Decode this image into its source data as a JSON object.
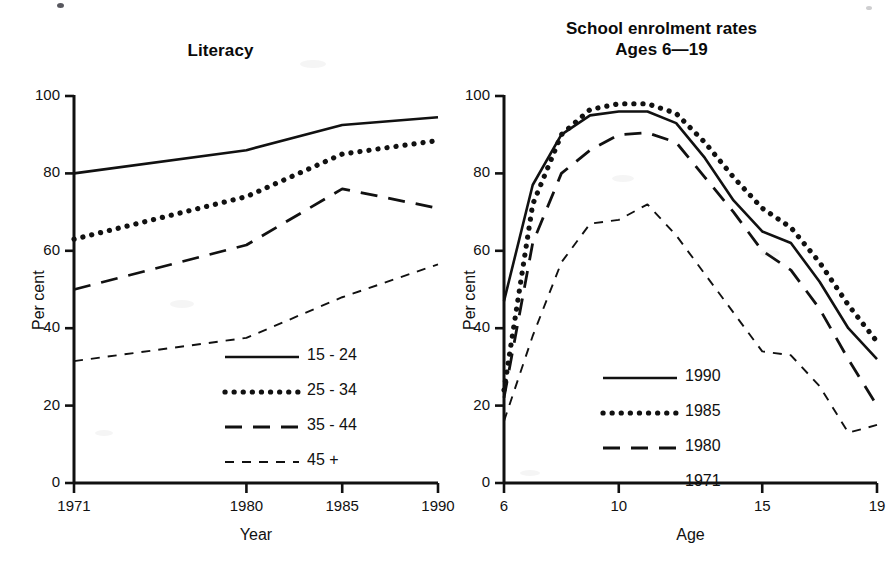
{
  "figure": {
    "background": "#ffffff",
    "ink_color": "#111111"
  },
  "panels": [
    {
      "id": "literacy",
      "title": "Literacy",
      "title_line2": "",
      "ylabel": "Per cent",
      "xlabel": "Year"
    },
    {
      "id": "enrolment",
      "title": "School enrolment rates",
      "title_line2": "Ages 6—19",
      "ylabel": "Per cent",
      "xlabel": "Age"
    }
  ],
  "chart_data": [
    {
      "type": "line",
      "title": "Literacy",
      "xlabel": "Year",
      "ylabel": "Per cent",
      "x": [
        1971,
        1980,
        1985,
        1990
      ],
      "xticks": [
        1971,
        1980,
        1985,
        1990
      ],
      "xticklabels": [
        "1971",
        "1980",
        "1985",
        "1990"
      ],
      "xlim": [
        1971,
        1990
      ],
      "yticks": [
        0,
        20,
        40,
        60,
        80,
        100
      ],
      "yticklabels": [
        "0",
        "20",
        "40",
        "60",
        "80",
        "100"
      ],
      "ylim": [
        0,
        100
      ],
      "grid": false,
      "legend_position": "lower right",
      "series": [
        {
          "name": "15 - 24",
          "style": "solid",
          "values": [
            80.0,
            86.0,
            92.5,
            94.5
          ]
        },
        {
          "name": "25 - 34",
          "style": "dotted",
          "values": [
            63.0,
            74.0,
            85.0,
            88.5
          ]
        },
        {
          "name": "35 - 44",
          "style": "long-dash",
          "values": [
            50.0,
            61.5,
            76.0,
            71.0
          ]
        },
        {
          "name": "45 +",
          "style": "short-dash",
          "values": [
            31.5,
            37.5,
            48.0,
            56.5
          ]
        }
      ]
    },
    {
      "type": "line",
      "title": "School enrolment rates Ages 6—19",
      "xlabel": "Age",
      "ylabel": "Per cent",
      "x": [
        6,
        7,
        8,
        9,
        10,
        11,
        12,
        13,
        14,
        15,
        16,
        17,
        18,
        19
      ],
      "xticks": [
        6,
        10,
        15,
        19
      ],
      "xticklabels": [
        "6",
        "10",
        "15",
        "19"
      ],
      "xlim": [
        6,
        19
      ],
      "yticks": [
        0,
        20,
        40,
        60,
        80,
        100
      ],
      "yticklabels": [
        "0",
        "20",
        "40",
        "60",
        "80",
        "100"
      ],
      "ylim": [
        0,
        100
      ],
      "grid": false,
      "legend_position": "lower center",
      "series": [
        {
          "name": "1990",
          "style": "solid",
          "values": [
            47.0,
            77.0,
            90.0,
            95.0,
            96.0,
            96.0,
            93.0,
            84.0,
            73.0,
            65.0,
            62.0,
            52.0,
            40.0,
            32.0
          ]
        },
        {
          "name": "1985",
          "style": "dotted",
          "values": [
            24.0,
            72.0,
            90.0,
            96.5,
            98.0,
            98.0,
            95.5,
            88.0,
            79.0,
            71.0,
            66.0,
            57.0,
            46.0,
            36.5
          ]
        },
        {
          "name": "1980",
          "style": "long-dash",
          "values": [
            22.0,
            62.0,
            80.0,
            86.0,
            90.0,
            90.5,
            88.0,
            79.0,
            70.0,
            60.0,
            55.0,
            45.0,
            32.0,
            20.0
          ]
        },
        {
          "name": "1971",
          "style": "short-dash",
          "values": [
            16.0,
            38.0,
            57.0,
            67.0,
            68.0,
            72.0,
            64.0,
            54.0,
            44.0,
            34.0,
            33.0,
            25.0,
            13.0,
            15.0
          ]
        }
      ]
    }
  ],
  "legends": [
    {
      "panel": "literacy",
      "entries": [
        {
          "label": "15 - 24",
          "style": "solid"
        },
        {
          "label": "25 - 34",
          "style": "dotted"
        },
        {
          "label": "35 - 44",
          "style": "long-dash"
        },
        {
          "label": "45 +",
          "style": "short-dash"
        }
      ]
    },
    {
      "panel": "enrolment",
      "entries": [
        {
          "label": "1990",
          "style": "solid"
        },
        {
          "label": "1985",
          "style": "dotted"
        },
        {
          "label": "1980",
          "style": "long-dash"
        },
        {
          "label": "1971",
          "style": "short-dash"
        }
      ]
    }
  ]
}
